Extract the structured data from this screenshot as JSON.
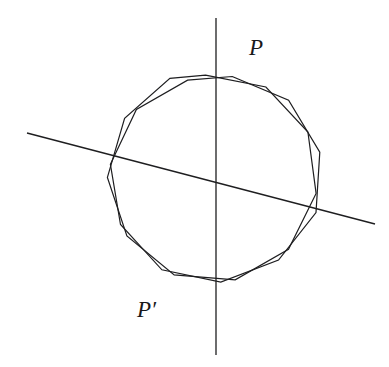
{
  "figure": {
    "background_color": "#ffffff",
    "stroke_color": "#1e1e20",
    "width": 389,
    "height": 367,
    "labels": [
      {
        "name": "point-p",
        "text": "P",
        "x": 249,
        "y": 36
      },
      {
        "name": "point-p-prime",
        "text": "P′",
        "x": 137,
        "y": 298
      }
    ]
  },
  "chart_data": {
    "type": "line",
    "xlabel": "",
    "ylabel": "",
    "grid": false,
    "legend": "none",
    "xlim": [
      0,
      389
    ],
    "ylim": [
      367,
      0
    ],
    "annotations": [
      {
        "label": "P",
        "x": 249,
        "y": 36
      },
      {
        "label": "P′",
        "x": 137,
        "y": 298
      }
    ],
    "center": {
      "x": 214,
      "y": 186
    },
    "radius": 111,
    "sides": 11,
    "series": [
      {
        "name": "polygon-original",
        "type": "closed-polygon",
        "rotation_deg": -7,
        "stroke": "#1e1e20",
        "stroke_width": 1.2,
        "points": [
          [
            205.5,
            75.2
          ],
          [
            265.9,
            87.0
          ],
          [
            307.9,
            132.0
          ],
          [
            316.1,
            193.5
          ],
          [
            288.5,
            249.2
          ],
          [
            235.2,
            279.8
          ],
          [
            174.2,
            274.9
          ],
          [
            126.9,
            235.9
          ],
          [
            107.4,
            177.4
          ],
          [
            124.6,
            118.3
          ],
          [
            169.9,
            78.4
          ]
        ]
      },
      {
        "name": "polygon-rotated",
        "type": "closed-polygon",
        "rotation_deg": 9,
        "stroke": "#1e1e20",
        "stroke_width": 1.2,
        "points": [
          [
            232.2,
            76.5
          ],
          [
            288.6,
            100.3
          ],
          [
            319.8,
            152.1
          ],
          [
            316.0,
            212.5
          ],
          [
            278.5,
            260.0
          ],
          [
            220.8,
            282.1
          ],
          [
            161.9,
            269.8
          ],
          [
            120.5,
            224.5
          ],
          [
            110.4,
            164.3
          ],
          [
            136.4,
            109.5
          ],
          [
            187.6,
            80.2
          ]
        ]
      },
      {
        "name": "axis-vertical",
        "type": "line",
        "stroke": "#1e1e20",
        "stroke_width": 1.3,
        "points": [
          [
            216,
            18
          ],
          [
            216,
            355
          ]
        ]
      },
      {
        "name": "axis-slanted",
        "type": "line",
        "stroke": "#1e1e20",
        "stroke_width": 1.3,
        "points": [
          [
            27,
            133
          ],
          [
            375,
            224
          ]
        ]
      }
    ]
  }
}
